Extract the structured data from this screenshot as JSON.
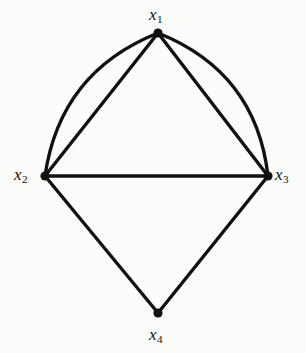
{
  "figure": {
    "kind": "multigraph-diagram",
    "background_color": "#fcfcfb",
    "stroke_color": "#111111",
    "width": 306,
    "height": 353
  },
  "nodes": [
    {
      "id": "x1",
      "base": "x",
      "sub": "1",
      "x": 158,
      "y": 33,
      "radius": 4.6,
      "label_text": "x",
      "label_sub": "1",
      "label_position": "above"
    },
    {
      "id": "x2",
      "base": "x",
      "sub": "2",
      "x": 45,
      "y": 176,
      "radius": 4.6,
      "label_text": "x",
      "label_sub": "2",
      "label_position": "left"
    },
    {
      "id": "x3",
      "base": "x",
      "sub": "3",
      "x": 268,
      "y": 176,
      "radius": 4.6,
      "label_text": "x",
      "label_sub": "3",
      "label_position": "right"
    },
    {
      "id": "x4",
      "base": "x",
      "sub": "4",
      "x": 158,
      "y": 313,
      "radius": 4.6,
      "label_text": "x",
      "label_sub": "4",
      "label_position": "below"
    }
  ],
  "edges": [
    {
      "id": "e-x1-x2-straight",
      "from": "x1",
      "to": "x2",
      "shape": "straight",
      "width": 3.4
    },
    {
      "id": "e-x1-x2-curved",
      "from": "x1",
      "to": "x2",
      "shape": "curved",
      "bulge": "outward-left",
      "control": {
        "x": 60,
        "y": 72
      },
      "width": 3.4
    },
    {
      "id": "e-x1-x3-straight",
      "from": "x1",
      "to": "x3",
      "shape": "straight",
      "width": 3.4
    },
    {
      "id": "e-x1-x3-curved",
      "from": "x1",
      "to": "x3",
      "shape": "curved",
      "bulge": "outward-right",
      "control": {
        "x": 256,
        "y": 72
      },
      "width": 3.4
    },
    {
      "id": "e-x2-x3",
      "from": "x2",
      "to": "x3",
      "shape": "straight",
      "width": 3.4
    },
    {
      "id": "e-x2-x4",
      "from": "x2",
      "to": "x4",
      "shape": "straight",
      "width": 3.4
    },
    {
      "id": "e-x3-x4",
      "from": "x3",
      "to": "x4",
      "shape": "straight",
      "width": 3.4
    }
  ],
  "paths": {
    "e-x1-x2-straight": "M 158 33 L 45 176",
    "e-x1-x2-curved": "M 158 33 Q 60 72 45 176",
    "e-x1-x3-straight": "M 158 33 L 268 176",
    "e-x1-x3-curved": "M 158 33 Q 256 72 268 176",
    "e-x2-x3": "M 45 176 L 268 176",
    "e-x2-x4": "M 45 176 L 158 313",
    "e-x3-x4": "M 268 176 L 158 313"
  },
  "labels": {
    "x1": {
      "text": "x",
      "sub": "1"
    },
    "x2": {
      "text": "x",
      "sub": "2"
    },
    "x3": {
      "text": "x",
      "sub": "3"
    },
    "x4": {
      "text": "x",
      "sub": "4"
    }
  }
}
